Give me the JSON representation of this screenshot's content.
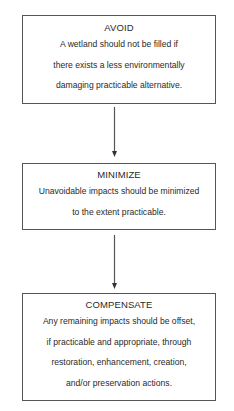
{
  "diagram": {
    "type": "flowchart",
    "direction": "top-to-bottom",
    "colors": {
      "border": "#555555",
      "text": "#2a2a2a",
      "background": "#ffffff"
    },
    "steps": [
      {
        "title": "AVOID",
        "lines": [
          "A wetland should not be filled if",
          "there exists a less environmentally",
          "damaging practicable alternative."
        ]
      },
      {
        "title": "MINIMIZE",
        "lines": [
          "Unavoidable impacts should be minimized",
          "to the extent practicable."
        ]
      },
      {
        "title": "COMPENSATE",
        "lines": [
          "Any remaining impacts should be offset,",
          "if practicable and appropriate, through",
          "restoration, enhancement, creation,",
          "and/or preservation actions."
        ]
      }
    ],
    "connections": [
      {
        "from": "AVOID",
        "to": "MINIMIZE",
        "icon": "arrow-down-icon"
      },
      {
        "from": "MINIMIZE",
        "to": "COMPENSATE",
        "icon": "arrow-down-icon"
      }
    ]
  }
}
